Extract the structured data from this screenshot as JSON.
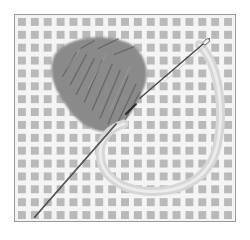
{
  "image": {
    "description": "Grayscale illustration of needlepoint canvas with a yarn-filled stitched patch, a loose yarn loop, and a tapestry needle passing diagonally through the mesh",
    "colors": {
      "background": "#ffffff",
      "frame_border": "#9a9a9a",
      "canvas_threads": "#f4f4f4",
      "canvas_holes": "#b9b9b9",
      "stitched_yarn": "#7c7c7c",
      "loose_yarn": "#dcdcdc",
      "needle": "#3a3a3a"
    },
    "elements": [
      {
        "name": "needlepoint-canvas",
        "label": "Mesh canvas grid"
      },
      {
        "name": "stitched-yarn-patch",
        "label": "Dark yarn stitches (tent/diagonal stitches)"
      },
      {
        "name": "loose-yarn-loop",
        "label": "Light yarn loop"
      },
      {
        "name": "tapestry-needle",
        "label": "Needle threaded through canvas"
      }
    ]
  }
}
